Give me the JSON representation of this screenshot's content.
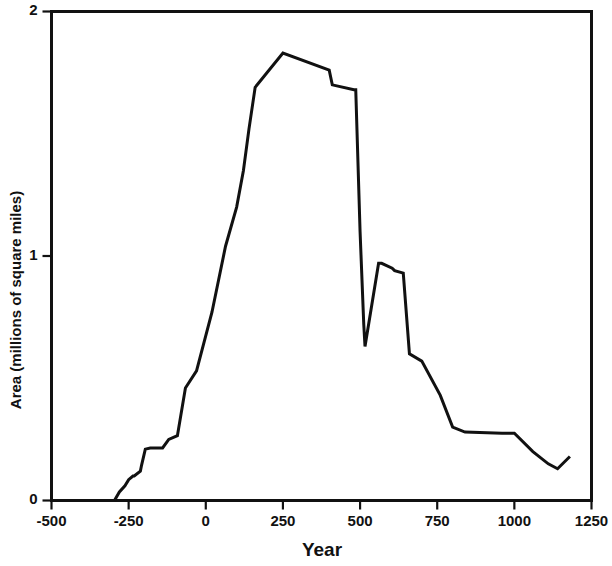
{
  "chart_data": {
    "type": "line",
    "title": "",
    "xlabel": "Year",
    "ylabel": "Area (millions of square miles)",
    "xlim": [
      -500,
      1250
    ],
    "ylim": [
      0,
      2
    ],
    "xticks": [
      -500,
      -250,
      0,
      250,
      500,
      750,
      1000,
      1250
    ],
    "xtick_labels": [
      "-500",
      "-250",
      "0",
      "250",
      "500",
      "750",
      "1000",
      "1250"
    ],
    "yticks": [
      0,
      1,
      2
    ],
    "ytick_labels": [
      "0",
      "1",
      "2"
    ],
    "grid": false,
    "legend": null,
    "line_color": "#111111",
    "series": [
      {
        "name": "Area",
        "x": [
          -296,
          -280,
          -262,
          -250,
          -236,
          -232,
          -212,
          -208,
          -196,
          -180,
          -140,
          -120,
          -92,
          -66,
          -30,
          20,
          64,
          100,
          122,
          140,
          160,
          250,
          400,
          410,
          480,
          486,
          500,
          512,
          516,
          560,
          570,
          604,
          612,
          640,
          660,
          700,
          760,
          800,
          840,
          960,
          1000,
          1060,
          1110,
          1140,
          1180
        ],
        "y": [
          0.0,
          0.035,
          0.06,
          0.085,
          0.1,
          0.1,
          0.12,
          0.145,
          0.21,
          0.215,
          0.215,
          0.25,
          0.265,
          0.46,
          0.53,
          0.77,
          1.04,
          1.2,
          1.35,
          1.52,
          1.69,
          1.83,
          1.76,
          1.7,
          1.68,
          1.68,
          1.1,
          0.72,
          0.63,
          0.97,
          0.97,
          0.95,
          0.94,
          0.93,
          0.6,
          0.57,
          0.43,
          0.3,
          0.28,
          0.275,
          0.275,
          0.2,
          0.15,
          0.13,
          0.18
        ]
      }
    ]
  },
  "axes": {
    "y_axis_name": "y-axis",
    "x_axis_name": "x-axis"
  }
}
